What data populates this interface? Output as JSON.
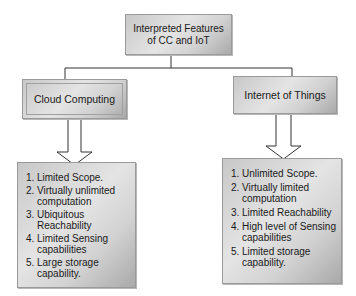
{
  "title": "Interpreted Features of CC and IoT",
  "title_lines": [
    "Interpreted Features",
    "of CC and IoT"
  ],
  "branches": [
    {
      "label": "Cloud Computing",
      "features": [
        {
          "num": "1.",
          "lines": [
            "Limited Scope."
          ]
        },
        {
          "num": "2.",
          "lines": [
            "Virtually unlimited",
            "computation"
          ]
        },
        {
          "num": "3.",
          "lines": [
            "Ubiquitous",
            "Reachability"
          ]
        },
        {
          "num": "4.",
          "lines": [
            "Limited Sensing",
            "capabilities"
          ]
        },
        {
          "num": "5.",
          "lines": [
            "Large storage",
            "capability."
          ]
        }
      ]
    },
    {
      "label": "Internet of Things",
      "features": [
        {
          "num": "1.",
          "lines": [
            "Unlimited Scope."
          ]
        },
        {
          "num": "2.",
          "lines": [
            "Virtually limited",
            "computation"
          ]
        },
        {
          "num": "3.",
          "lines": [
            "Limited Reachability"
          ]
        },
        {
          "num": "4.",
          "lines": [
            "High level of Sensing",
            "capabilities"
          ]
        },
        {
          "num": "5.",
          "lines": [
            "Limited storage",
            "capability."
          ]
        }
      ]
    }
  ]
}
